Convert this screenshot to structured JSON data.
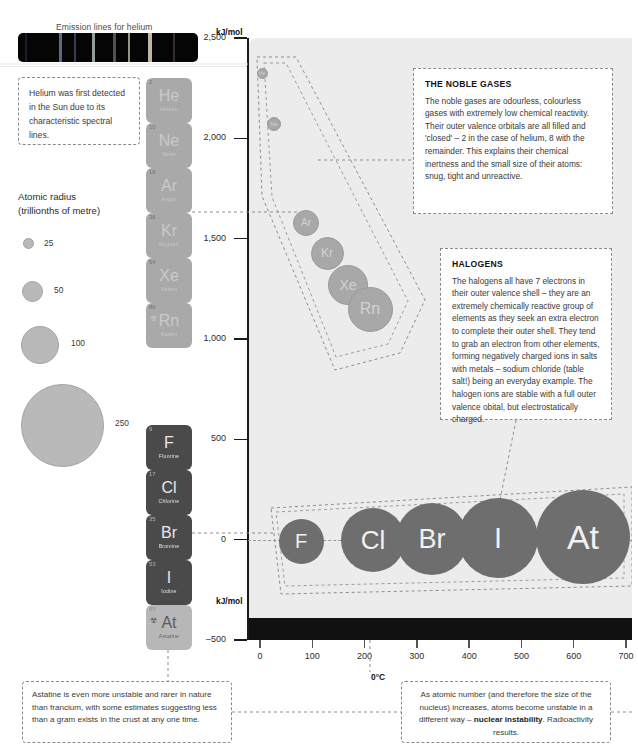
{
  "spectrum": {
    "title": "Emission lines for helium",
    "lines": [
      {
        "left_pct": 4,
        "width_pct": 1.2,
        "color": "#2e2e4f",
        "opacity": 0.55
      },
      {
        "left_pct": 23,
        "width_pct": 1.6,
        "color": "#6f7aa0",
        "opacity": 0.85
      },
      {
        "left_pct": 31,
        "width_pct": 1.0,
        "color": "#4a5575",
        "opacity": 0.7
      },
      {
        "left_pct": 41,
        "width_pct": 2.0,
        "color": "#9fb0a8",
        "opacity": 0.9
      },
      {
        "left_pct": 53,
        "width_pct": 1.2,
        "color": "#6a7a6a",
        "opacity": 0.7
      },
      {
        "left_pct": 61,
        "width_pct": 1.4,
        "color": "#b9b9a0",
        "opacity": 0.8
      },
      {
        "left_pct": 72,
        "width_pct": 2.2,
        "color": "#c8c0b0",
        "opacity": 0.95
      },
      {
        "left_pct": 86,
        "width_pct": 1.1,
        "color": "#5a4848",
        "opacity": 0.6
      }
    ]
  },
  "notes": {
    "helium": "Helium was first detected in the Sun due to its characteristic spectral lines.",
    "astatine": "Astatine is even more unstable and rarer in nature than francium, with some estimates suggesting less than a gram exists in the crust at any one time.",
    "nuclear_pre": "As atomic number (and therefore the size of the nucleus) increases, atoms become unstable in a different way – ",
    "nuclear_bold": "nuclear instability",
    "nuclear_post": ". Radioactivity results."
  },
  "callouts": {
    "noble": {
      "title": "THE NOBLE GASES",
      "body": "The noble gases are odourless, colourless gases with extremely low chemical reactivity. Their outer valence orbitals are all filled and 'closed' – 2 in the case of helium, 8 with the remainder. This explains their chemical inertness and the small size of their atoms: snug, tight and unreactive."
    },
    "halogens": {
      "title": "HALOGENS",
      "body": "The halogens all have 7 electrons in their outer valence shell – they are an extremely chemically reactive group of elements as they seek an extra electron to complete their outer shell. They tend to grab an electron from other elements, forming negatively charged ions in salts with metals – sodium chloride (table salt!) being an everyday example. The halogen ions are stable with a full outer valence obital, but electrostatically charged."
    }
  },
  "legend": {
    "title_line1": "Atomic radius",
    "title_line2": "(trillionths of metre)",
    "items": [
      {
        "value": "25",
        "d": 9,
        "cx": 27,
        "cy": 242,
        "lx": 44,
        "ly": 238
      },
      {
        "value": "50",
        "d": 19,
        "cx": 31,
        "cy": 290,
        "lx": 54,
        "ly": 285
      },
      {
        "value": "100",
        "d": 36,
        "cx": 39,
        "cy": 344,
        "lx": 71,
        "ly": 338
      },
      {
        "value": "250",
        "d": 81,
        "cx": 61,
        "cy": 424,
        "lx": 115,
        "ly": 418
      }
    ]
  },
  "tiles": {
    "noble": [
      {
        "num": "2",
        "symbol": "He",
        "name": "Helium",
        "top": 78,
        "radioactive": false
      },
      {
        "num": "10",
        "symbol": "Ne",
        "name": "Neon",
        "top": 123,
        "radioactive": false
      },
      {
        "num": "18",
        "symbol": "Ar",
        "name": "Argon",
        "top": 168,
        "radioactive": false
      },
      {
        "num": "36",
        "symbol": "Kr",
        "name": "Krypton",
        "top": 213,
        "radioactive": false
      },
      {
        "num": "54",
        "symbol": "Xe",
        "name": "Xenon",
        "top": 258,
        "radioactive": false
      },
      {
        "num": "86",
        "symbol": "Rn",
        "name": "Radon",
        "top": 303,
        "radioactive": true
      }
    ],
    "halogen": [
      {
        "num": "9",
        "symbol": "F",
        "name": "Fluorine",
        "top": 425,
        "radioactive": false,
        "astatine": false
      },
      {
        "num": "17",
        "symbol": "Cl",
        "name": "Chlorine",
        "top": 470,
        "radioactive": false,
        "astatine": false
      },
      {
        "num": "35",
        "symbol": "Br",
        "name": "Bromine",
        "top": 515,
        "radioactive": false,
        "astatine": false
      },
      {
        "num": "53",
        "symbol": "I",
        "name": "Iodine",
        "top": 560,
        "radioactive": false,
        "astatine": false
      },
      {
        "num": "85",
        "symbol": "At",
        "name": "Astatine",
        "top": 605,
        "radioactive": true,
        "astatine": true
      }
    ]
  },
  "axes": {
    "y_unit_top": "kJ/mol",
    "y_unit_bottom": "kJ/mol",
    "y_ticks": [
      "2,500",
      "2,000",
      "1,500",
      "1,000",
      "500",
      "0",
      "–500"
    ],
    "x_ticks": [
      "0",
      "100",
      "200",
      "300",
      "400",
      "500",
      "600",
      "700"
    ],
    "zero_celsius": "0°C"
  },
  "chart_data": {
    "type": "scatter",
    "xlabel": "kJ/mol",
    "ylabel": "kJ/mol",
    "xlim": [
      0,
      700
    ],
    "ylim": [
      -500,
      2500
    ],
    "grid": false,
    "legend": "none",
    "size_encoding": "bubble diameter = atomic radius in trillionths of a metre",
    "series": [
      {
        "name": "Noble gases",
        "color": "#a8a8a8",
        "points": [
          {
            "label": "He",
            "x": 10,
            "y": 2372,
            "radius": 31
          },
          {
            "label": "Ne",
            "x": 25,
            "y": 2081,
            "radius": 38
          },
          {
            "label": "Ar",
            "x": 70,
            "y": 1521,
            "radius": 71
          },
          {
            "label": "Kr",
            "x": 110,
            "y": 1351,
            "radius": 88
          },
          {
            "label": "Xe",
            "x": 150,
            "y": 1170,
            "radius": 108
          },
          {
            "label": "Rn",
            "x": 185,
            "y": 1037,
            "radius": 120
          }
        ]
      },
      {
        "name": "Halogens",
        "color": "#6e6e6e",
        "points": [
          {
            "label": "F",
            "x": 45,
            "y": -328,
            "radius": 42
          },
          {
            "label": "Cl",
            "x": 180,
            "y": -349,
            "radius": 79
          },
          {
            "label": "Br",
            "x": 280,
            "y": -325,
            "radius": 94
          },
          {
            "label": "I",
            "x": 390,
            "y": -295,
            "radius": 115
          },
          {
            "label": "At",
            "x": 530,
            "y": -270,
            "radius": 150
          }
        ]
      }
    ]
  },
  "bubbles_px": {
    "noble": [
      {
        "label": "He",
        "cx": 262,
        "cy": 73,
        "d": 11,
        "fs": 5
      },
      {
        "label": "Ne",
        "cx": 274,
        "cy": 124,
        "d": 14,
        "fs": 6
      },
      {
        "label": "Ar",
        "cx": 306,
        "cy": 223,
        "d": 26,
        "fs": 10
      },
      {
        "label": "Kr",
        "cx": 327,
        "cy": 253,
        "d": 33,
        "fs": 12
      },
      {
        "label": "Xe",
        "cx": 348,
        "cy": 285,
        "d": 40,
        "fs": 14
      },
      {
        "label": "Rn",
        "cx": 370,
        "cy": 309,
        "d": 45,
        "fs": 16
      }
    ],
    "halogen": [
      {
        "label": "F",
        "cx": 301,
        "cy": 541,
        "d": 45,
        "fs": 20
      },
      {
        "label": "Cl",
        "cx": 373,
        "cy": 540,
        "d": 64,
        "fs": 26
      },
      {
        "label": "Br",
        "cx": 432,
        "cy": 539,
        "d": 72,
        "fs": 27
      },
      {
        "label": "I",
        "cx": 498,
        "cy": 538,
        "d": 80,
        "fs": 29
      },
      {
        "label": "At",
        "cx": 583,
        "cy": 537,
        "d": 94,
        "fs": 34
      }
    ]
  }
}
